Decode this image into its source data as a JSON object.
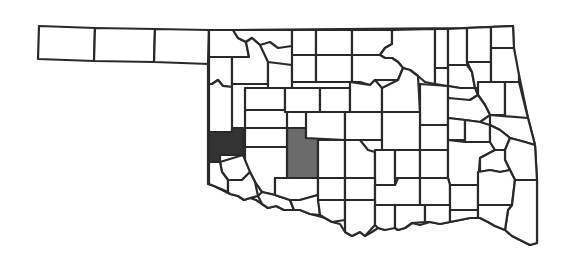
{
  "map": {
    "title": "Oklahoma county distribution map",
    "region": "Oklahoma",
    "colors": {
      "background": "#ffffff",
      "outline": "#2a2a2a",
      "county_fill": "#ffffff",
      "highlight_dark": "#333333",
      "highlight_medium": "#6b6b6b"
    },
    "highlighted_counties": [
      {
        "name": "Beckham",
        "shade": "dark",
        "color": "#333333"
      },
      {
        "name": "Caddo-Custer area",
        "shade": "medium",
        "color": "#6b6b6b"
      }
    ]
  }
}
